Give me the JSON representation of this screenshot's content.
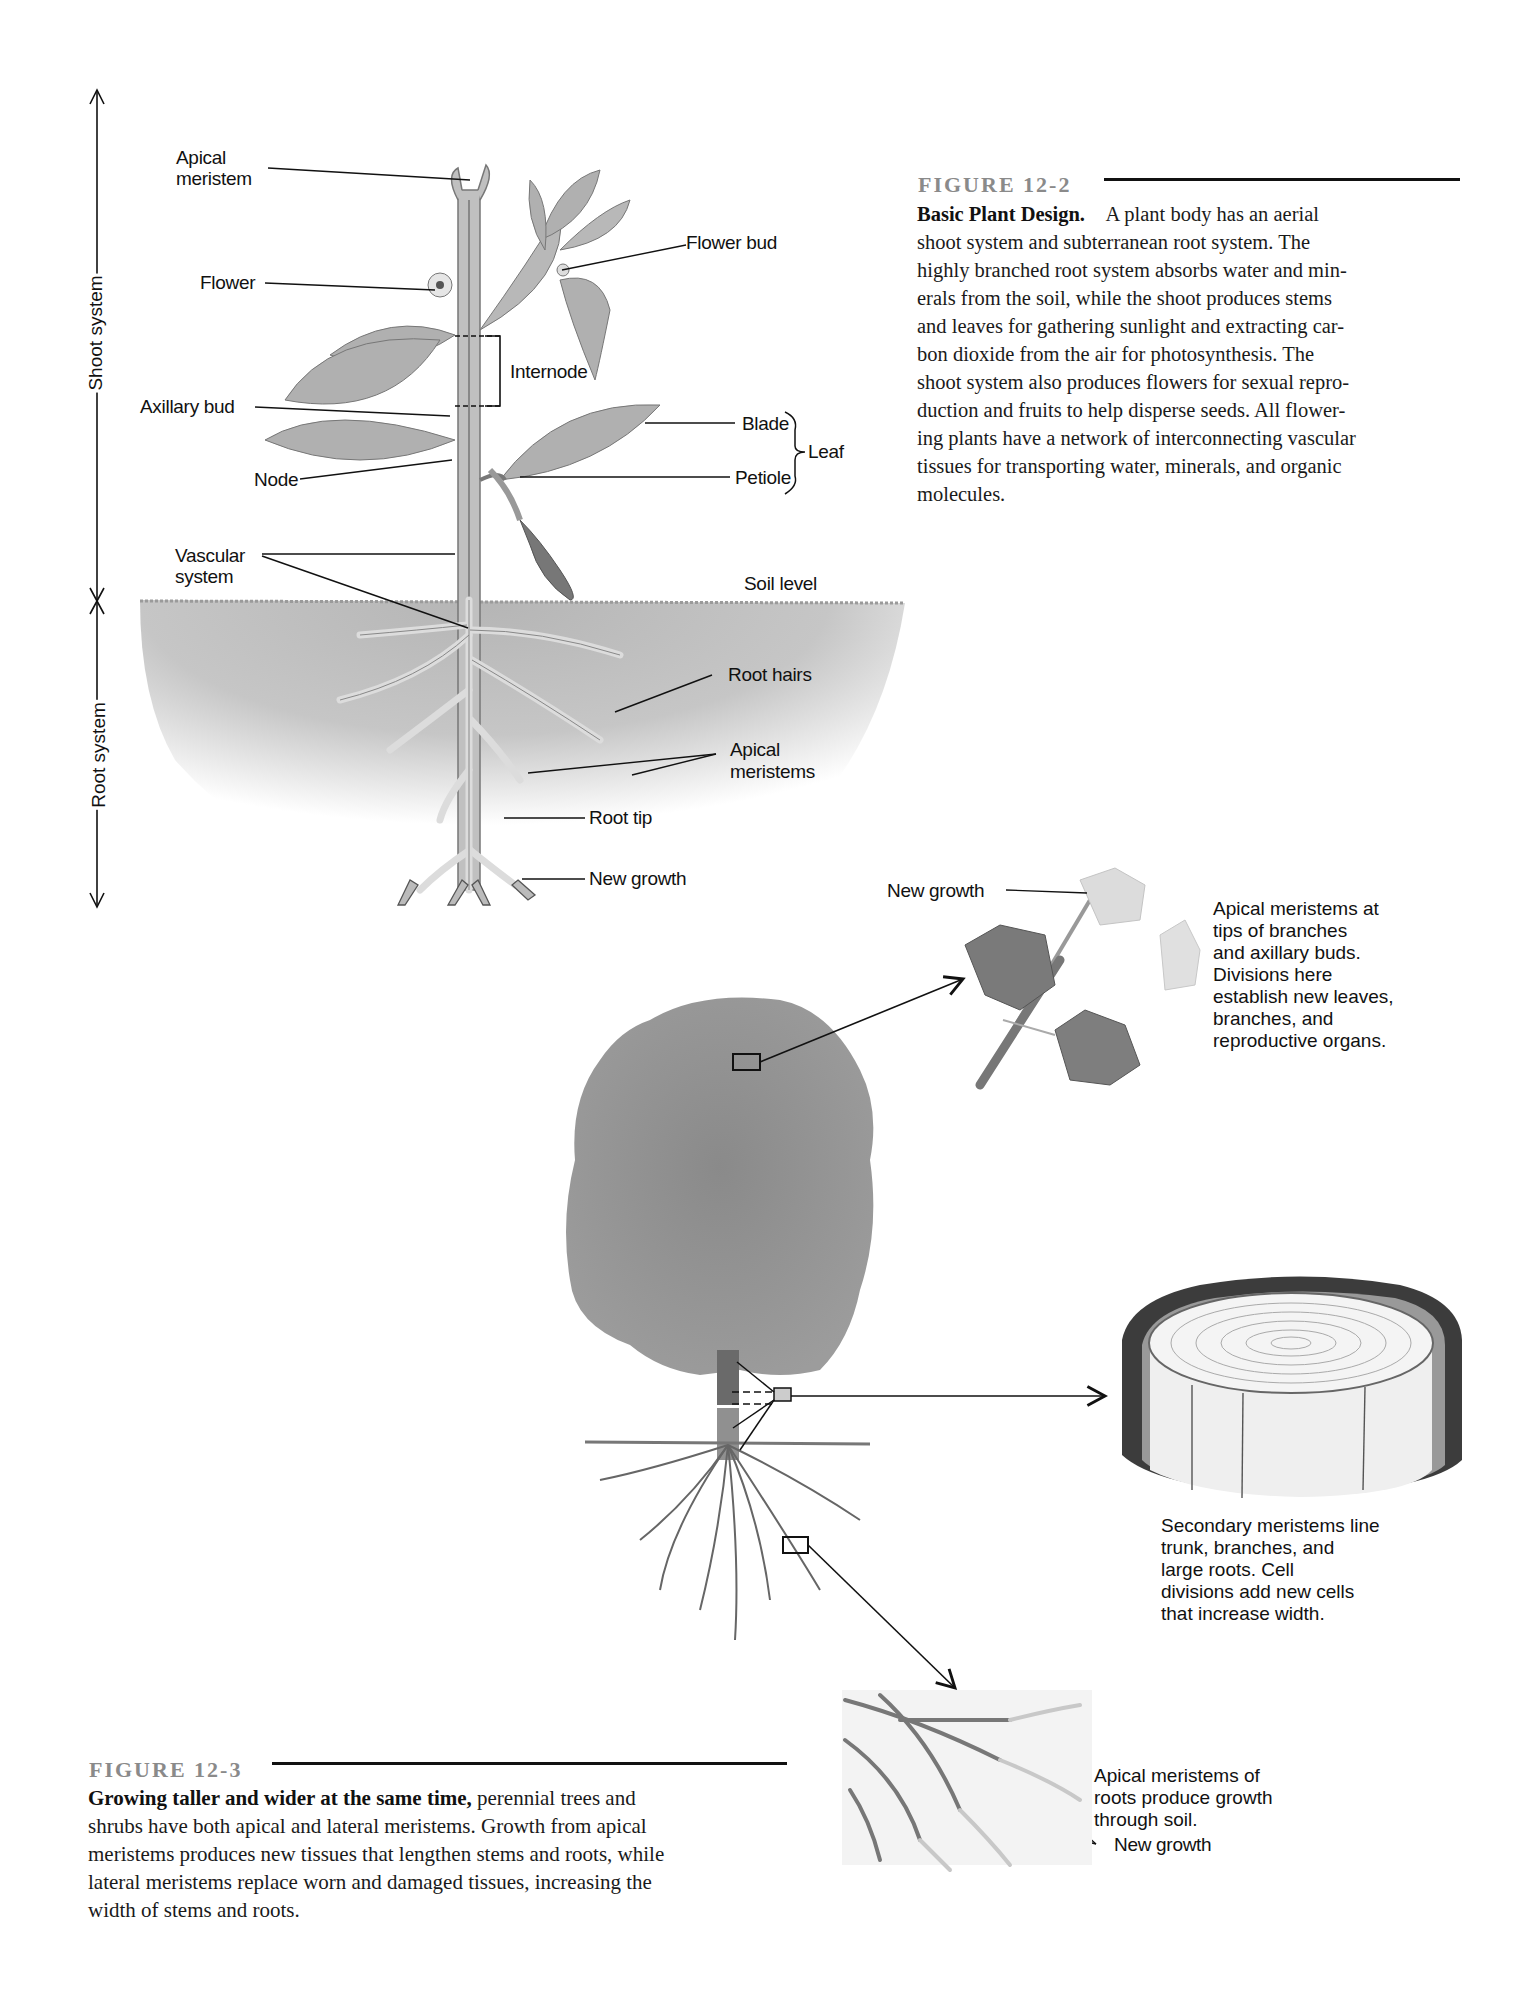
{
  "figure_12_2": {
    "label": "FIGURE 12-2",
    "title": "Basic Plant Design.",
    "body": "A plant body has an aerial shoot system and subterranean root system. The highly branched root system absorbs water and minerals from the soil, while the shoot produces stems and leaves for gathering sunlight and extracting carbon dioxide from the air for photosynthesis. The shoot system also produces flowers for sexual reproduction and fruits to help disperse seeds. All flowering plants have a network of interconnecting vascular tissues for transporting water, minerals, and organic molecules.",
    "lines": [
      "shoot system and subterranean root system. The",
      "highly branched root system absorbs water and min-",
      "erals from the soil, while the shoot produces stems",
      "and leaves for gathering sunlight and extracting car-",
      "bon dioxide from the air for photosynthesis. The",
      "shoot system also produces flowers for sexual repro-",
      "duction and fruits to help disperse seeds. All flower-",
      "ing plants have a network of interconnecting vascular",
      "tissues for transporting water, minerals, and organic",
      "molecules."
    ],
    "first_line_rest": "A plant body has an aerial",
    "axis": {
      "shoot_system": "Shoot system",
      "root_system": "Root system"
    },
    "labels": {
      "apical_meristem_1": "Apical",
      "apical_meristem_2": "meristem",
      "flower": "Flower",
      "flower_bud": "Flower bud",
      "internode": "Internode",
      "axillary_bud": "Axillary bud",
      "blade": "Blade",
      "leaf": "Leaf",
      "node": "Node",
      "petiole": "Petiole",
      "vascular_1": "Vascular",
      "vascular_2": "system",
      "soil_level": "Soil level",
      "root_hairs": "Root hairs",
      "apical_meristems_1": "Apical",
      "apical_meristems_2": "meristems",
      "root_tip": "Root tip",
      "new_growth": "New growth"
    }
  },
  "figure_12_3": {
    "label": "FIGURE 12-3",
    "title": "Growing taller and wider at the same time,",
    "first_line_rest": "perennial trees and",
    "lines": [
      "shrubs have both apical and lateral meristems. Growth from apical",
      "meristems produces new tissues that lengthen stems and roots, while",
      "lateral meristems replace worn and damaged tissues, increasing the",
      "width of stems and roots."
    ],
    "callouts": {
      "branch_new_growth": "New growth",
      "branch_caption": [
        "Apical meristems at",
        "tips of branches",
        "and axillary buds.",
        "Divisions here",
        "establish new leaves,",
        "branches, and",
        "reproductive organs."
      ],
      "trunk_caption": [
        "Secondary meristems line",
        "trunk, branches, and",
        "large roots. Cell",
        "divisions add new cells",
        "that increase width."
      ],
      "roots_caption": [
        "Apical meristems of",
        "roots produce growth",
        "through soil."
      ],
      "roots_new_growth": "New growth"
    }
  },
  "colors": {
    "text": "#111111",
    "figure_label": "#8a8a8a",
    "plant_fill": "#b8b8b8",
    "plant_stroke": "#777777",
    "soil": "#c4c4c4",
    "tree_canopy": "#8e8e8e"
  }
}
